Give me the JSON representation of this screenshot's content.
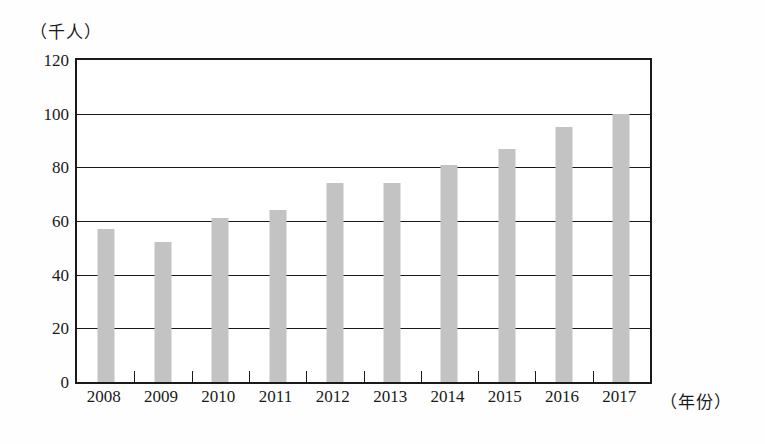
{
  "chart_data": {
    "type": "bar",
    "title": "",
    "subtitle": "",
    "xlabel": "（年份）",
    "ylabel": "（千人）",
    "categories": [
      "2008",
      "2009",
      "2010",
      "2011",
      "2012",
      "2013",
      "2014",
      "2015",
      "2016",
      "2017"
    ],
    "values": [
      57,
      52,
      61,
      64,
      74,
      74,
      81,
      87,
      95,
      100
    ],
    "series": [
      {
        "name": "人数",
        "values": [
          57,
          52,
          61,
          64,
          74,
          74,
          81,
          87,
          95,
          100
        ]
      }
    ],
    "ylim": [
      0,
      120
    ],
    "yticks": [
      0,
      20,
      40,
      60,
      80,
      100,
      120
    ],
    "ytick_labels": [
      "0",
      "20",
      "40",
      "60",
      "80",
      "100",
      "120"
    ],
    "grid": "horizontal",
    "legend": "none",
    "bar_color": "#c3c3c3",
    "axis_color": "#1a1a1a",
    "annotations": []
  }
}
